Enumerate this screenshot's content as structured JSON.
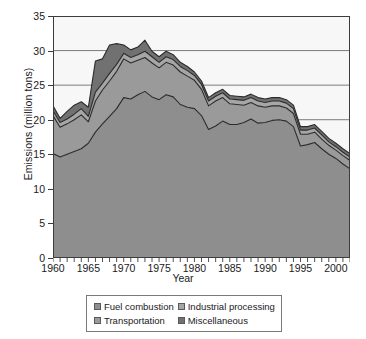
{
  "chart_data": {
    "type": "area",
    "stacked": true,
    "title": "",
    "xlabel": "Year",
    "ylabel": "Emissions (million tons)",
    "xlim": [
      1960,
      2002
    ],
    "ylim": [
      0,
      35
    ],
    "ytick_values": [
      0,
      5,
      10,
      15,
      20,
      25,
      30,
      35
    ],
    "ytick_labels": [
      "0",
      "5",
      "10",
      "15",
      "20",
      "25",
      "30",
      "35"
    ],
    "xtick_values": [
      1960,
      1965,
      1970,
      1975,
      1980,
      1985,
      1990,
      1995,
      2000
    ],
    "xtick_labels": [
      "1960",
      "1965",
      "1970",
      "1975",
      "1980",
      "1985",
      "1990",
      "1995",
      "2000"
    ],
    "minor_xticks_every": 1,
    "grid": "horizontal",
    "legend_position": "bottom",
    "x": [
      1960,
      1961,
      1962,
      1963,
      1964,
      1965,
      1966,
      1967,
      1968,
      1969,
      1970,
      1971,
      1972,
      1973,
      1974,
      1975,
      1976,
      1977,
      1978,
      1979,
      1980,
      1981,
      1982,
      1983,
      1984,
      1985,
      1986,
      1987,
      1988,
      1989,
      1990,
      1991,
      1992,
      1993,
      1994,
      1995,
      1996,
      1997,
      1998,
      1999,
      2000,
      2001,
      2002
    ],
    "series": [
      {
        "name": "Fuel combustion",
        "color": "#8e8e8e",
        "values": [
          15.1,
          14.6,
          15.0,
          15.4,
          15.8,
          16.6,
          18.2,
          19.4,
          20.5,
          21.6,
          23.2,
          23.0,
          23.6,
          24.1,
          23.3,
          22.9,
          23.6,
          23.3,
          22.2,
          21.8,
          21.6,
          20.6,
          18.6,
          19.1,
          19.8,
          19.3,
          19.3,
          19.6,
          20.1,
          19.5,
          19.6,
          19.9,
          20.0,
          19.8,
          19.0,
          16.2,
          16.4,
          16.7,
          15.8,
          15.0,
          14.4,
          13.6,
          12.9
        ]
      },
      {
        "name": "Transportation",
        "color": "#9a9a9a",
        "values": [
          5.5,
          4.3,
          4.4,
          4.6,
          4.9,
          3.1,
          4.5,
          4.9,
          5.1,
          5.4,
          5.6,
          5.2,
          5.0,
          4.9,
          4.9,
          4.6,
          4.7,
          4.6,
          4.7,
          4.5,
          4.1,
          3.8,
          3.4,
          3.6,
          3.4,
          3.0,
          2.9,
          2.5,
          2.4,
          2.5,
          2.2,
          2.1,
          2.0,
          1.9,
          1.9,
          1.7,
          1.5,
          1.5,
          1.4,
          1.3,
          1.2,
          1.2,
          1.2
        ]
      },
      {
        "name": "Industrial processing",
        "color": "#a6a6a6",
        "values": [
          0.7,
          0.7,
          0.7,
          0.8,
          0.9,
          0.8,
          1.3,
          1.0,
          1.1,
          1.0,
          0.8,
          0.8,
          0.8,
          0.9,
          0.9,
          0.8,
          0.8,
          0.8,
          0.8,
          0.8,
          0.7,
          0.7,
          0.7,
          0.7,
          0.7,
          0.7,
          0.7,
          0.7,
          0.7,
          0.7,
          0.7,
          0.7,
          0.7,
          0.7,
          0.7,
          0.6,
          0.6,
          0.6,
          0.6,
          0.5,
          0.5,
          0.5,
          0.5
        ]
      },
      {
        "name": "Miscellaneous",
        "color": "#717171",
        "values": [
          0.7,
          0.6,
          1.1,
          1.3,
          1.0,
          1.3,
          4.5,
          3.5,
          4.1,
          3.0,
          1.2,
          1.1,
          1.1,
          1.6,
          0.8,
          0.8,
          0.8,
          0.7,
          0.6,
          0.6,
          0.5,
          0.5,
          0.5,
          0.5,
          0.5,
          0.5,
          0.5,
          0.5,
          0.5,
          0.5,
          0.5,
          0.5,
          0.5,
          0.5,
          0.5,
          0.5,
          0.5,
          0.5,
          0.5,
          0.5,
          0.5,
          0.5,
          0.5
        ]
      }
    ]
  },
  "legend": {
    "entries": [
      {
        "label": "Fuel combustion",
        "color": "#8e8e8e"
      },
      {
        "label": "Industrial processing",
        "color": "#a6a6a6"
      },
      {
        "label": "Transportation",
        "color": "#9a9a9a"
      },
      {
        "label": "Miscellaneous",
        "color": "#717171"
      }
    ]
  },
  "style": {
    "plot_background": "#f7f7f7",
    "axis_color": "#3c3c3c",
    "grid_color": "#6e6e6e",
    "line_color": "#2b2b2b"
  }
}
